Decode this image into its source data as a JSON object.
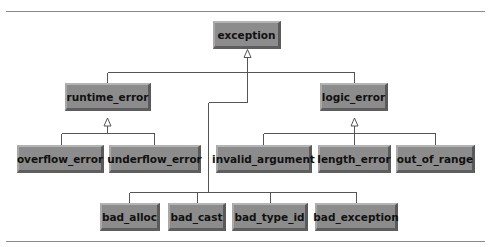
{
  "diagram": {
    "type": "class-hierarchy",
    "root": "exception",
    "nodes": [
      {
        "id": "exception",
        "label": "exception"
      },
      {
        "id": "runtime_error",
        "label": "runtime_error"
      },
      {
        "id": "logic_error",
        "label": "logic_error"
      },
      {
        "id": "overflow_error",
        "label": "overflow_error"
      },
      {
        "id": "underflow_error",
        "label": "underflow_error"
      },
      {
        "id": "invalid_argument",
        "label": "invalid_argument"
      },
      {
        "id": "length_error",
        "label": "length_error"
      },
      {
        "id": "out_of_range",
        "label": "out_of_range"
      },
      {
        "id": "bad_alloc",
        "label": "bad_alloc"
      },
      {
        "id": "bad_cast",
        "label": "bad_cast"
      },
      {
        "id": "bad_type_id",
        "label": "bad_type_id"
      },
      {
        "id": "bad_exception",
        "label": "bad_exception"
      }
    ],
    "edges": [
      {
        "from": "runtime_error",
        "to": "exception",
        "type": "inheritance"
      },
      {
        "from": "logic_error",
        "to": "exception",
        "type": "inheritance"
      },
      {
        "from": "bad_alloc",
        "to": "exception",
        "type": "inheritance"
      },
      {
        "from": "bad_cast",
        "to": "exception",
        "type": "inheritance"
      },
      {
        "from": "bad_type_id",
        "to": "exception",
        "type": "inheritance"
      },
      {
        "from": "bad_exception",
        "to": "exception",
        "type": "inheritance"
      },
      {
        "from": "overflow_error",
        "to": "runtime_error",
        "type": "inheritance"
      },
      {
        "from": "underflow_error",
        "to": "runtime_error",
        "type": "inheritance"
      },
      {
        "from": "invalid_argument",
        "to": "logic_error",
        "type": "inheritance"
      },
      {
        "from": "length_error",
        "to": "logic_error",
        "type": "inheritance"
      },
      {
        "from": "out_of_range",
        "to": "logic_error",
        "type": "inheritance"
      }
    ]
  },
  "colors": {
    "box_fill": "#8c8c8c",
    "box_highlight": "#b4b4b4",
    "box_shadow": "#5a5a5a",
    "line": "#555555",
    "rule": "#8a8a8a"
  }
}
